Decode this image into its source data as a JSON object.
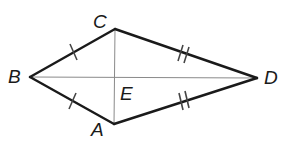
{
  "figure": {
    "type": "kite",
    "colors": {
      "side": "#1a1a1a",
      "diagonal": "#8a8a8a",
      "tick": "#444444"
    },
    "vertices": {
      "A": {
        "label": "A",
        "x": 114,
        "y": 124
      },
      "B": {
        "label": "B",
        "x": 30,
        "y": 77
      },
      "C": {
        "label": "C",
        "x": 115,
        "y": 29
      },
      "D": {
        "label": "D",
        "x": 257,
        "y": 78
      },
      "E": {
        "label": "E",
        "x": 115,
        "y": 77
      }
    },
    "sides": [
      {
        "from": "B",
        "to": "C",
        "ticks": 1
      },
      {
        "from": "C",
        "to": "D",
        "ticks": 2
      },
      {
        "from": "D",
        "to": "A",
        "ticks": 2
      },
      {
        "from": "A",
        "to": "B",
        "ticks": 1
      }
    ],
    "diagonals": [
      {
        "from": "B",
        "to": "D"
      },
      {
        "from": "C",
        "to": "A"
      }
    ],
    "congruence_notes": [
      "BC ≅ BA (single tick)",
      "CD ≅ AD (double tick)"
    ]
  }
}
